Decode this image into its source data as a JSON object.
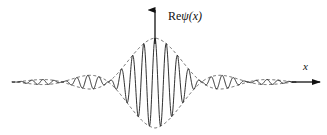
{
  "figure": {
    "title": "",
    "background_color": "#ffffff",
    "width": 327,
    "height": 135
  },
  "axes": {
    "vertical": {
      "label_prefix": "Re",
      "label_symbol": "ψ",
      "label_argument": "(x)",
      "label_full": "Reψ(x)",
      "arrow_color": "#111111",
      "origin_x": 155,
      "arrow_top_y": 8,
      "arrow_bottom_y": 44
    },
    "horizontal": {
      "label": "x",
      "arrow_color": "#111111",
      "baseline_y": 82,
      "arrow_start_x": 291,
      "arrow_end_x": 322
    }
  },
  "curve": {
    "name": "Re psi(x)",
    "color": "#1a1a1a",
    "stroke_width": 0.9,
    "type": "oscillation"
  },
  "envelope": {
    "name": "envelope",
    "color": "#444444",
    "stroke_width": 0.8,
    "dash_pattern": "3,2.5",
    "type": "dashed"
  },
  "chart_data": {
    "type": "line",
    "title": "",
    "subtitle": "",
    "xlabel": "x",
    "ylabel": "Reψ(x)",
    "legend": [],
    "grid": false,
    "xlim": [
      -1.0,
      1.0
    ],
    "ylim": [
      -1.0,
      1.0
    ],
    "series": [
      {
        "name": "Reψ(x)",
        "style": "solid",
        "color": "#1a1a1a",
        "description": "Carrier oscillation modulated by sinc envelope"
      },
      {
        "name": "envelope",
        "style": "dashed",
        "color": "#444444",
        "description": "Upper and lower sinc-like envelope bounding the oscillation"
      }
    ],
    "envelope_lobes": [
      {
        "name": "far-left-tail",
        "x_start": 12,
        "x_end": 30,
        "peak_amplitude": 0.09
      },
      {
        "name": "left-side-lobe",
        "x_start": 30,
        "x_end": 88,
        "peak_amplitude": 0.21
      },
      {
        "name": "central-lobe",
        "x_start": 88,
        "x_end": 222,
        "peak_amplitude": 1.0
      },
      {
        "name": "right-side-lobe",
        "x_start": 222,
        "x_end": 278,
        "peak_amplitude": 0.21
      },
      {
        "name": "far-right-tail",
        "x_start": 278,
        "x_end": 295,
        "peak_amplitude": 0.09
      }
    ],
    "carrier_peaks_in_central_lobe": 12,
    "annotations": [
      {
        "text": "Reψ(x)",
        "position": "above-vertical-arrow"
      },
      {
        "text": "x",
        "position": "above-right-arrow-tip"
      }
    ]
  }
}
